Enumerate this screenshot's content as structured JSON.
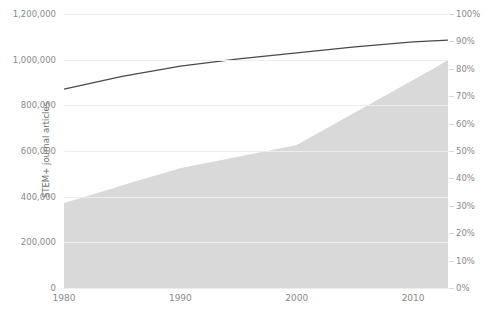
{
  "chart_data": {
    "type": "area",
    "title": "",
    "subtitle": "",
    "xlabel": "",
    "ylabel": "STEM+ journal articles",
    "y2label": "",
    "xlim": [
      1980,
      2013
    ],
    "ylim": [
      0,
      1200000
    ],
    "y2lim": [
      0,
      100
    ],
    "grid": true,
    "legend": "none",
    "x_ticks": [
      "1980",
      "1990",
      "2000",
      "2010"
    ],
    "x_tick_values": [
      1980,
      1990,
      2000,
      2010
    ],
    "y_ticks": [
      "0",
      "200,000",
      "400,000",
      "600,000",
      "800,000",
      "1,000,000",
      "1,200,000"
    ],
    "y_tick_values": [
      0,
      200000,
      400000,
      600000,
      800000,
      1000000,
      1200000
    ],
    "y2_ticks": [
      "0%",
      "10%",
      "20%",
      "30%",
      "40%",
      "50%",
      "60%",
      "70%",
      "80%",
      "90%",
      "100%"
    ],
    "y2_tick_values": [
      0,
      10,
      20,
      30,
      40,
      50,
      60,
      70,
      80,
      90,
      100
    ],
    "series": [
      {
        "name": "STEM+ journal articles",
        "type": "area",
        "axis": "left",
        "color": "#d9d9d9",
        "x": [
          1980,
          1982,
          1984,
          1986,
          1988,
          1990,
          1992,
          1994,
          1996,
          1998,
          2000,
          2002,
          2004,
          2006,
          2008,
          2010,
          2012,
          2013
        ],
        "values": [
          372000,
          403000,
          434000,
          465000,
          495000,
          525000,
          545000,
          565000,
          586000,
          606000,
          626000,
          683000,
          740000,
          797000,
          854000,
          911000,
          968000,
          1000000
        ]
      },
      {
        "name": "Share",
        "type": "line",
        "axis": "right",
        "color": "#4a4a4a",
        "x": [
          1980,
          1985,
          1990,
          1995,
          2000,
          2005,
          2010,
          2013
        ],
        "values": [
          72.6,
          77.2,
          81.0,
          83.6,
          85.8,
          88.0,
          89.8,
          90.5
        ]
      }
    ]
  }
}
